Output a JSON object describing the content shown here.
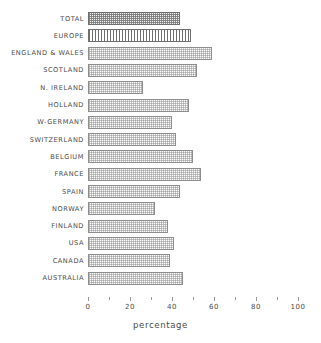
{
  "chart_data": {
    "type": "bar",
    "orientation": "horizontal",
    "title": "",
    "xlabel": "percentage",
    "ylabel": "",
    "xlim": [
      0,
      100
    ],
    "ylim": null,
    "grid": false,
    "legend": null,
    "xticks": [
      0,
      20,
      40,
      60,
      80,
      100
    ],
    "xtick_labels": [
      "0",
      "20",
      "40",
      "60",
      "80",
      "100"
    ],
    "minor_xticks": [
      10,
      30,
      50,
      70,
      90
    ],
    "categories": [
      "TOTAL",
      "EUROPE",
      "ENGLAND & WALES",
      "SCOTLAND",
      "N. IRELAND",
      "HOLLAND",
      "W-GERMANY",
      "SWITZERLAND",
      "BELGIUM",
      "FRANCE",
      "SPAIN",
      "NORWAY",
      "FINLAND",
      "USA",
      "CANADA",
      "AUSTRALIA"
    ],
    "values": [
      44,
      49,
      59,
      52,
      26,
      48,
      40,
      42,
      50,
      54,
      44,
      32,
      38,
      41,
      39,
      45
    ],
    "bar_styles": [
      "checker",
      "vstripe",
      "stipple",
      "stipple",
      "stipple",
      "stipple",
      "stipple",
      "stipple",
      "stipple",
      "stipple",
      "stipple",
      "stipple",
      "stipple",
      "stipple",
      "stipple",
      "stipple"
    ]
  },
  "colors": {
    "background": "#ffffff",
    "bar_border": "#8d8d8d",
    "bar_fill": "#fdfdfd",
    "text": "#4a4a4a",
    "axis": "#9a9a9a"
  }
}
